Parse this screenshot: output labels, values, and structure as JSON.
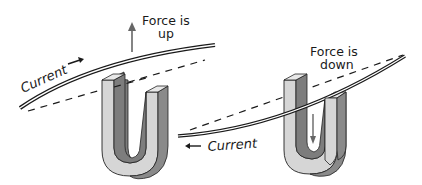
{
  "diagram": {
    "colors": {
      "ink": "#1a1a1a",
      "magnet_light": "#d6d6d6",
      "magnet_dark": "#7d7d7d",
      "magnet_top": "#e8e8e8",
      "arrow": "#666666"
    },
    "panels": [
      {
        "id": "left",
        "force_label_line1": "Force is",
        "force_label_line2": "up",
        "force_direction": "up",
        "current_label": "Current",
        "current_direction": "right",
        "current_arrow_glyph": "→"
      },
      {
        "id": "right",
        "force_label_line1": "Force is",
        "force_label_line2": "down",
        "force_direction": "down",
        "current_label": "Current",
        "current_direction": "left",
        "current_arrow_glyph": "←"
      }
    ]
  }
}
